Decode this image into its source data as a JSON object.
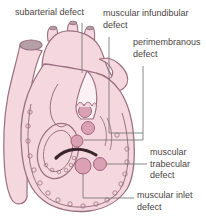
{
  "figure": {
    "labels": {
      "subarterial": "subarterial defect",
      "infundibular": "muscular infundibular defect",
      "perimembranous": "perimembranous defect",
      "trabecular": "muscular trabecular defect",
      "inlet": "muscular inlet defect"
    },
    "colors": {
      "background": "#ffffff",
      "heart_fill": "#f5d7df",
      "heart_outline": "#9a7080",
      "vessel_opening": "#b5a0a8",
      "defect_fill": "#d9a1b3",
      "defect_outline": "#a4647c",
      "moderator_band": "#3c262e",
      "leader_line": "#7b7b7b",
      "label_text": "#4a4444"
    }
  }
}
